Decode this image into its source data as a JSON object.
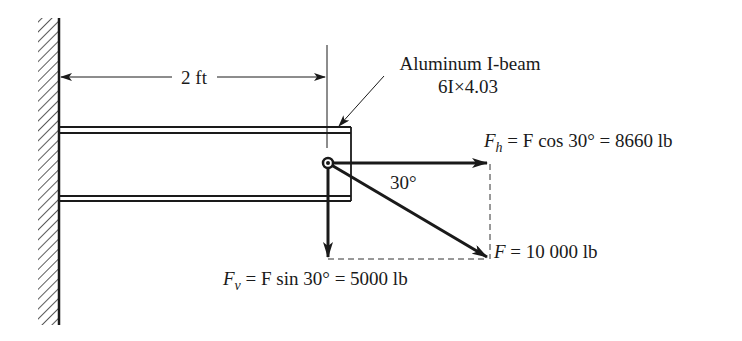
{
  "figure": {
    "dimension_label": "2 ft",
    "beam_label_line1": "Aluminum I-beam",
    "beam_label_line2": "6I×4.03",
    "angle_label": "30°",
    "fh": {
      "symbol": "F",
      "subscript": "h",
      "expression": " = F cos 30° = 8660 lb"
    },
    "fv": {
      "symbol": "F",
      "subscript": "v",
      "expression": " = F sin 30° = 5000 lb"
    },
    "f": {
      "symbol": "F",
      "expression": " = 10 000 lb"
    }
  },
  "colors": {
    "ink": "#1a1a1a",
    "background": "#ffffff"
  }
}
